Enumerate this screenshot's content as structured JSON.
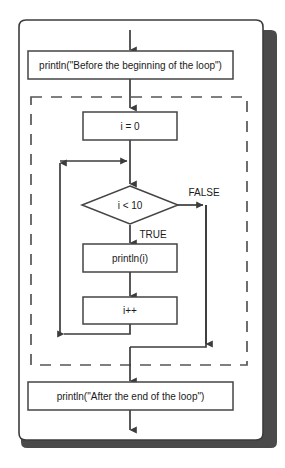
{
  "diagram": {
    "type": "flowchart",
    "colors": {
      "canvas": "#ffffff",
      "stroke": "#3c3c3c",
      "node_fill": "#ffffff",
      "node_stroke": "#444444",
      "shadow": "#4a4a4a",
      "dashed_stroke": "#555555",
      "text": "#1a1a1a"
    },
    "outer_container": {
      "shape": "rounded-rectangle",
      "has_shadow": true
    },
    "loop_region": {
      "shape": "dashed-rectangle",
      "meaning": "the for loop"
    },
    "nodes": [
      {
        "id": "before",
        "shape": "rectangle",
        "label": "println(\"Before the beginning of the loop\")"
      },
      {
        "id": "init",
        "shape": "rectangle",
        "label": "i = 0"
      },
      {
        "id": "decision",
        "shape": "diamond",
        "label": "i < 10"
      },
      {
        "id": "body",
        "shape": "rectangle",
        "label": "println(i)"
      },
      {
        "id": "update",
        "shape": "rectangle",
        "label": "i++"
      },
      {
        "id": "after",
        "shape": "rectangle",
        "label": "println(\"After the end of the loop\")"
      }
    ],
    "edge_labels": {
      "false_branch": "FALSE",
      "true_branch": "TRUE"
    }
  },
  "caption": {
    "text": ""
  }
}
